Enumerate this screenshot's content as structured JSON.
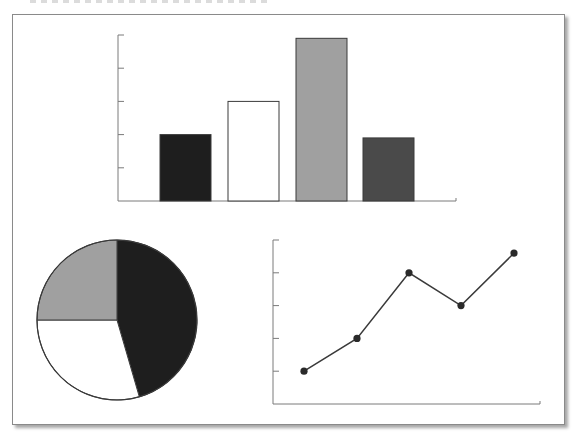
{
  "figure": {
    "frame_border_color": "#8a8a8a",
    "axis_color": "#7a7a7a"
  },
  "chart_data": [
    {
      "type": "bar",
      "title": "",
      "xlabel": "",
      "ylabel": "",
      "categories": [
        "1",
        "2",
        "3",
        "4"
      ],
      "values": [
        2.0,
        3.0,
        4.9,
        1.9
      ],
      "colors": [
        "#1e1e1e",
        "#ffffff",
        "#a0a0a0",
        "#4a4a4a"
      ],
      "ylim": [
        0,
        5
      ],
      "y_ticks": [
        1,
        2,
        3,
        4,
        5
      ],
      "tick_labels_visible": false,
      "grid": false,
      "legend": null
    },
    {
      "type": "pie",
      "title": "",
      "slices": [
        {
          "label": "black",
          "value": 45.5,
          "color": "#1e1e1e"
        },
        {
          "label": "white",
          "value": 29.5,
          "color": "#ffffff"
        },
        {
          "label": "gray",
          "value": 25.0,
          "color": "#a0a0a0"
        }
      ],
      "start_angle": "12 o'clock",
      "direction": "clockwise",
      "legend": null
    },
    {
      "type": "line",
      "title": "",
      "xlabel": "",
      "ylabel": "",
      "x": [
        1,
        2,
        3,
        4,
        5
      ],
      "values": [
        1.0,
        2.0,
        4.0,
        3.0,
        4.6
      ],
      "marker": "circle",
      "line_color": "#3a3a3a",
      "ylim": [
        0,
        5
      ],
      "y_ticks": [
        1,
        2,
        3,
        4,
        5
      ],
      "tick_labels_visible": false,
      "grid": false,
      "legend": null
    }
  ]
}
